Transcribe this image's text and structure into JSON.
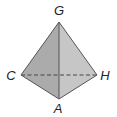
{
  "diagram": {
    "type": "tetrahedron",
    "vertices": {
      "G": {
        "label": "G",
        "x": 59,
        "y": 22,
        "label_x": 59,
        "label_y": 15
      },
      "C": {
        "label": "C",
        "x": 21,
        "y": 75,
        "label_x": 11,
        "label_y": 80
      },
      "H": {
        "label": "H",
        "x": 97,
        "y": 75,
        "label_x": 105,
        "label_y": 80
      },
      "A": {
        "label": "A",
        "x": 59,
        "y": 99,
        "label_x": 58,
        "label_y": 113
      }
    },
    "faces": [
      {
        "name": "left-face",
        "vertices": [
          "G",
          "C",
          "A"
        ],
        "color": "#ababab"
      },
      {
        "name": "right-face",
        "vertices": [
          "G",
          "A",
          "H"
        ],
        "color": "#c6c6c6"
      }
    ],
    "edges": [
      {
        "from": "G",
        "to": "C",
        "style": "solid"
      },
      {
        "from": "G",
        "to": "H",
        "style": "solid"
      },
      {
        "from": "G",
        "to": "A",
        "style": "solid"
      },
      {
        "from": "C",
        "to": "A",
        "style": "solid"
      },
      {
        "from": "A",
        "to": "H",
        "style": "solid"
      },
      {
        "from": "C",
        "to": "H",
        "style": "dashed"
      }
    ],
    "colors": {
      "edge": "#555555",
      "label": "#222222",
      "background": "#ffffff"
    }
  }
}
